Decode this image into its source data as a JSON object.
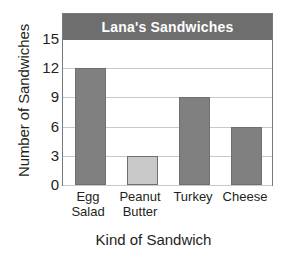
{
  "chart_data": {
    "type": "bar",
    "title": "Lana's Sandwiches",
    "xlabel": "Kind of Sandwich",
    "ylabel": "Number of Sandwiches",
    "categories": [
      "Egg Salad",
      "Peanut Butter",
      "Turkey",
      "Cheese"
    ],
    "category_lines": [
      [
        "Egg",
        "Salad"
      ],
      [
        "Peanut",
        "Butter"
      ],
      [
        "Turkey"
      ],
      [
        "Cheese"
      ]
    ],
    "values": [
      12,
      3,
      9,
      6
    ],
    "bar_colors": [
      "#808080",
      "#c8c8c8",
      "#808080",
      "#808080"
    ],
    "ylim": [
      0,
      15
    ],
    "yticks": [
      0,
      3,
      6,
      9,
      12,
      15
    ],
    "ytick_labels": [
      "0",
      "3",
      "6",
      "9",
      "12",
      "15"
    ],
    "grid": true,
    "legend": false,
    "colors": {
      "title_banner_bg": "#6e6e6e",
      "title_banner_text": "#ffffff",
      "gridline": "#c9c9c9",
      "frame_border": "#7a7a7a",
      "bar_border": "#6f6f6f",
      "bar_dark": "#808080",
      "bar_light": "#c8c8c8",
      "text": "#231f20",
      "background": "#ffffff"
    }
  }
}
